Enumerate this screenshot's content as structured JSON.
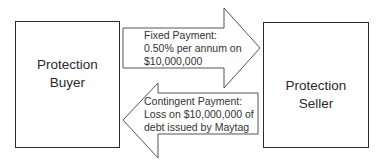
{
  "diagram": {
    "buyer_label": "Protection\nBuyer",
    "seller_label": "Protection\nSeller",
    "fixed_payment": {
      "direction": "buyer-to-seller",
      "text": "Fixed Payment:\n0.50% per annum on\n$10,000,000"
    },
    "contingent_payment": {
      "direction": "seller-to-buyer",
      "text": "Contingent Payment:\nLoss on $10,000,000 of\ndebt issued by Maytag"
    },
    "colors": {
      "stroke": "#2b2b2b",
      "fill": "#ffffff",
      "text": "#333333"
    }
  }
}
